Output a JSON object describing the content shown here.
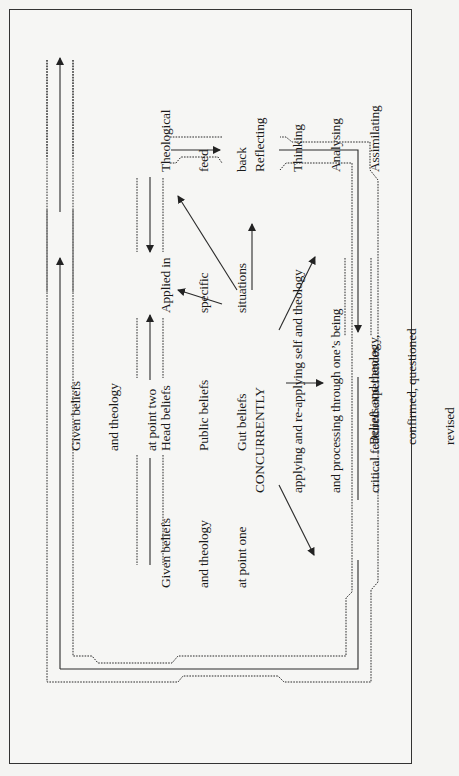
{
  "diagram": {
    "orientation": "rotated-90-ccw",
    "nodes": {
      "given_point_one": {
        "lines": [
          "Given beliefs",
          "and theology",
          "at point one"
        ]
      },
      "head_public_gut": {
        "lines": [
          "Head beliefs",
          "Public beliefs",
          "Gut beliefs"
        ]
      },
      "applied": {
        "lines": [
          "Applied in",
          "specific",
          "situations"
        ]
      },
      "theological_feedback": {
        "lines": [
          "Theological",
          "feed",
          "back"
        ]
      },
      "reflecting": {
        "lines": [
          "Reflecting",
          "Thinking",
          "Analysing",
          "Assimilating"
        ]
      },
      "concurrently": {
        "lines": [
          "CONCURRENTLY",
          "applying and re-applying self and theology",
          "and processing through one’s being",
          "critical featured experiences"
        ]
      },
      "beliefs_revised": {
        "lines": [
          "Beliefs and theology,",
          "confirmed, questioned",
          "revised"
        ]
      },
      "given_point_two": {
        "lines": [
          "Given beliefs",
          "and theology",
          "at point two"
        ]
      }
    },
    "edges": [
      {
        "from": "given_point_one",
        "to": "head_public_gut",
        "style": "solid"
      },
      {
        "from": "head_public_gut",
        "to": "applied",
        "style": "solid"
      },
      {
        "from": "applied",
        "to": "theological_feedback",
        "style": "solid",
        "direction": "back"
      },
      {
        "from": "theological_feedback",
        "to": "reflecting",
        "style": "solid"
      },
      {
        "from": "reflecting",
        "to": "beliefs_revised",
        "style": "solid"
      },
      {
        "from": "beliefs_revised",
        "to": "given_point_two",
        "style": "solid-loop"
      },
      {
        "from": "concurrently",
        "to": "applied",
        "style": "arrow"
      },
      {
        "from": "concurrently",
        "to": "theological_feedback",
        "style": "arrow"
      },
      {
        "from": "concurrently",
        "to": "reflecting",
        "style": "arrow"
      },
      {
        "from": "concurrently",
        "to": "beliefs_revised",
        "style": "arrow"
      }
    ],
    "colors": {
      "line": "#2a2a2a",
      "background": "#f6f6f4",
      "frame": "#333333"
    }
  }
}
